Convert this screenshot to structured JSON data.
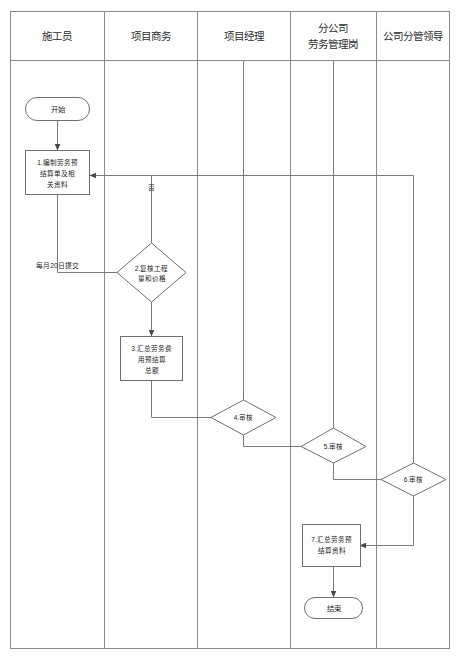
{
  "diagram": {
    "type": "swimlane-flowchart",
    "lanes": [
      {
        "id": "lane-1",
        "label": "施工员"
      },
      {
        "id": "lane-2",
        "label": "项目商务"
      },
      {
        "id": "lane-3",
        "label": "项目经理"
      },
      {
        "id": "lane-4",
        "label_line1": "分公司",
        "label_line2": "劳务管理岗"
      },
      {
        "id": "lane-5",
        "label": "公司分管领导"
      }
    ],
    "nodes": [
      {
        "id": "start",
        "shape": "terminator",
        "lane": "lane-1",
        "text": "开始"
      },
      {
        "id": "step1",
        "shape": "process",
        "lane": "lane-1",
        "lines": [
          "1.编制劳务预",
          "结算单及相",
          "关资料"
        ]
      },
      {
        "id": "step2",
        "shape": "decision",
        "lane": "lane-2",
        "lines": [
          "2.复核工程",
          "量和价格"
        ]
      },
      {
        "id": "step3",
        "shape": "process",
        "lane": "lane-2",
        "lines": [
          "3.汇总劳务费",
          "用预结算",
          "总额"
        ]
      },
      {
        "id": "step4",
        "shape": "decision",
        "lane": "lane-3",
        "lines": [
          "4.审核"
        ]
      },
      {
        "id": "step5",
        "shape": "decision",
        "lane": "lane-4",
        "lines": [
          "5.审核"
        ]
      },
      {
        "id": "step6",
        "shape": "decision",
        "lane": "lane-5",
        "lines": [
          "6.审核"
        ]
      },
      {
        "id": "step7",
        "shape": "process",
        "lane": "lane-4",
        "lines": [
          "7.汇总劳务预",
          "结算资料"
        ]
      },
      {
        "id": "end",
        "shape": "terminator",
        "lane": "lane-4",
        "text": "结束"
      }
    ],
    "edge_labels": {
      "reject": "否",
      "submit": "每月20日提交"
    },
    "colors": {
      "frame_stroke": "#8a8a8a",
      "shape_stroke": "#6f6f6f",
      "connector_stroke": "#7a7a7a",
      "text": "#1d1d1d",
      "background": "#ffffff"
    }
  }
}
